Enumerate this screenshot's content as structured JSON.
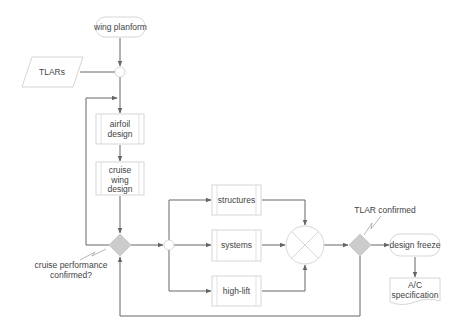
{
  "diagram": {
    "nodes": {
      "wing_planform": "wing planform",
      "tlars": "TLARs",
      "airfoil_design": [
        "airfoil",
        "design"
      ],
      "cruise_wing_design": [
        "cruise",
        "wing",
        "design"
      ],
      "structures": "structures",
      "systems": "systems",
      "high_lift": "high-lift",
      "design_freeze": "design freeze",
      "ac_specification": [
        "A/C",
        "specification"
      ]
    },
    "annotations": {
      "cruise_check": [
        "cruise performance",
        "confirmed?"
      ],
      "tlar_check": "TLAR confirmed"
    },
    "colors": {
      "edge": "#666666",
      "box_border": "#cccccc",
      "decision_fill": "#cccccc",
      "text": "#444444"
    }
  }
}
